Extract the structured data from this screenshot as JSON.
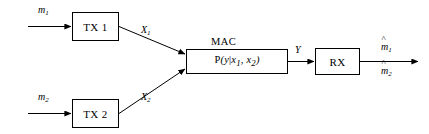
{
  "diagram": {
    "stroke_color": "#000000",
    "background_color": "#ffffff",
    "blocks": [
      {
        "id": "tx1",
        "label": "TX 1"
      },
      {
        "id": "tx2",
        "label": "TX 2"
      },
      {
        "id": "mac",
        "caption": "MAC"
      },
      {
        "id": "rx",
        "label": "RX"
      }
    ],
    "mac_formula": {
      "fn": "P",
      "open": "(",
      "output": "y",
      "bar": "|",
      "input1": "x",
      "input1_sub": "1",
      "comma": ", ",
      "input2": "x",
      "input2_sub": "2",
      "close": ")"
    },
    "signals": [
      {
        "id": "m1",
        "base": "m",
        "sub": "1",
        "hat": false
      },
      {
        "id": "m2",
        "base": "m",
        "sub": "2",
        "hat": false
      },
      {
        "id": "x1",
        "base": "X",
        "sub": "1",
        "hat": false
      },
      {
        "id": "x2",
        "base": "X",
        "sub": "2",
        "hat": false
      },
      {
        "id": "y",
        "base": "Y",
        "sub": "",
        "hat": false
      },
      {
        "id": "mhat1",
        "base": "m",
        "sub": "1",
        "hat": true
      },
      {
        "id": "mhat2",
        "base": "m",
        "sub": "2",
        "hat": true
      }
    ],
    "hat_glyph": "^"
  }
}
